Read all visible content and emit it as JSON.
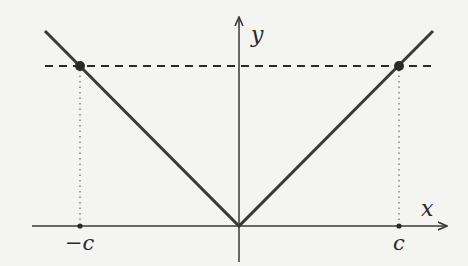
{
  "diagram": {
    "axes": {
      "x_label": "x",
      "y_label": "y"
    },
    "tick_labels": {
      "neg_c": "−c",
      "pos_c": "c"
    },
    "colors": {
      "background": "#f4f4f2",
      "line": "#3a3a3a",
      "axis": "#3a3a3a",
      "dashed": "#2a2a2a",
      "dotted": "#666666",
      "points": "#2a2a2a"
    }
  }
}
